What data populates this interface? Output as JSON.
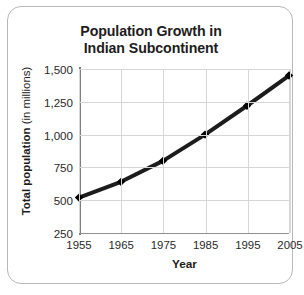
{
  "figure": {
    "title_line1": "Population Growth in",
    "title_line2": "Indian Subcontinent",
    "frame_border_color": "#b8b8b8",
    "background_color": "#ffffff"
  },
  "axes": {
    "y_title_bold": "Total population",
    "y_title_regular": "(in millions)",
    "x_title": "Year",
    "y_tick_labels": [
      "1,500",
      "1,250",
      "1,000",
      "750",
      "500",
      "250"
    ],
    "x_tick_labels": [
      "1955",
      "1965",
      "1975",
      "1985",
      "1995",
      "2005"
    ],
    "grid_color": "#d6d6d6",
    "axis_line_color": "#8f8f8f",
    "tick_label_color": "#2a2a2a"
  },
  "chart_data": {
    "type": "line",
    "title": "Population Growth in Indian Subcontinent",
    "xlabel": "Year",
    "ylabel": "Total population (in millions)",
    "x": [
      1955,
      1965,
      1975,
      1985,
      1995,
      2005
    ],
    "categories": [
      "1955",
      "1965",
      "1975",
      "1985",
      "1995",
      "2005"
    ],
    "values": [
      520,
      640,
      800,
      1000,
      1220,
      1450
    ],
    "series": [
      {
        "name": "Total population",
        "values": [
          520,
          640,
          800,
          1000,
          1220,
          1450
        ]
      }
    ],
    "xlim": [
      1955,
      2005
    ],
    "ylim": [
      250,
      1500
    ],
    "yticks": [
      250,
      500,
      750,
      1000,
      1250,
      1500
    ],
    "xticks": [
      1955,
      1965,
      1975,
      1985,
      1995,
      2005
    ],
    "grid": true,
    "legend": "none",
    "line_color": "#1c1c1c",
    "line_width": 4,
    "marker": "diamond",
    "marker_color": "#000000"
  }
}
